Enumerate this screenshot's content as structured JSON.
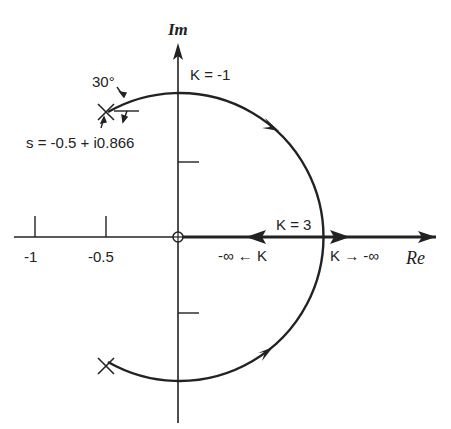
{
  "diagram": {
    "type": "root-locus",
    "axes": {
      "imag_label": "Im",
      "real_label": "Re",
      "real_ticks": [
        {
          "value": -1,
          "label": "-1"
        },
        {
          "value": -0.5,
          "label": "-0.5"
        }
      ],
      "imag_ticks": [
        0.5,
        -0.5
      ]
    },
    "poles": [
      {
        "re": -0.5,
        "im": 0.866
      },
      {
        "re": -0.5,
        "im": -0.866
      }
    ],
    "zero": {
      "re": 0,
      "im": 0
    },
    "annotations": {
      "k_top": "K = -1",
      "k_real": "K = 3",
      "k_left": "-∞ ← K",
      "k_right": "K → -∞",
      "angle": "30°",
      "pole_label": "s = -0.5 + i0.866"
    },
    "colors": {
      "ink": "#222222",
      "background": "#ffffff"
    }
  }
}
